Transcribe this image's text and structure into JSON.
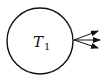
{
  "diagram": {
    "node": {
      "label": "T",
      "subscript": "1"
    },
    "arrows": [
      {
        "name": "arrow-upper"
      },
      {
        "name": "arrow-middle"
      },
      {
        "name": "arrow-lower"
      }
    ],
    "colors": {
      "stroke": "#111111",
      "background": "#ffffff"
    }
  }
}
